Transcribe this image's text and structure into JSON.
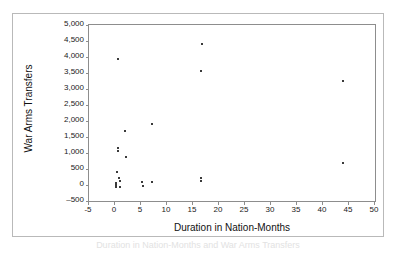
{
  "chart_data": {
    "type": "scatter",
    "title": "",
    "xlabel": "Duration in Nation-Months",
    "ylabel": "War Arms Transfers",
    "xlim": [
      -5,
      50
    ],
    "ylim": [
      -500,
      5000
    ],
    "grid": false,
    "legend": false,
    "xticks": [
      -5,
      0,
      5,
      10,
      15,
      20,
      25,
      30,
      35,
      40,
      45,
      50
    ],
    "xtick_labels": [
      "-5",
      "0",
      "5",
      "10",
      "15",
      "20",
      "25",
      "30",
      "35",
      "40",
      "45",
      "50"
    ],
    "yticks": [
      -500,
      0,
      500,
      1000,
      1500,
      2000,
      2500,
      3000,
      3500,
      4000,
      4500,
      5000
    ],
    "ytick_labels": [
      "–500",
      "0",
      "500",
      "1,000",
      "1,500",
      "2,000",
      "2,500",
      "3,000",
      "3,500",
      "4,000",
      "4,500",
      "5,000"
    ],
    "marker": "square",
    "marker_color": "#3a3a3a",
    "marker_size": 2,
    "points": [
      {
        "x": 0.6,
        "y": 3950
      },
      {
        "x": 0.5,
        "y": 1150
      },
      {
        "x": 0.5,
        "y": 1050
      },
      {
        "x": 2.0,
        "y": 1700
      },
      {
        "x": 2.2,
        "y": 870
      },
      {
        "x": 0.4,
        "y": 400
      },
      {
        "x": 0.8,
        "y": 230
      },
      {
        "x": 0.9,
        "y": 120
      },
      {
        "x": 0.1,
        "y": 60
      },
      {
        "x": 0.1,
        "y": 0
      },
      {
        "x": 0.2,
        "y": -60
      },
      {
        "x": 0.9,
        "y": -50
      },
      {
        "x": 5.2,
        "y": 90
      },
      {
        "x": 5.3,
        "y": -30
      },
      {
        "x": 7.1,
        "y": 1900
      },
      {
        "x": 7.2,
        "y": 80
      },
      {
        "x": 16.8,
        "y": 4400
      },
      {
        "x": 16.6,
        "y": 3550
      },
      {
        "x": 16.5,
        "y": 220
      },
      {
        "x": 16.5,
        "y": 120
      },
      {
        "x": 43.8,
        "y": 3250
      },
      {
        "x": 43.9,
        "y": 700
      }
    ]
  },
  "caption": {
    "text": "Duration in Nation-Months and War Arms Transfers"
  }
}
